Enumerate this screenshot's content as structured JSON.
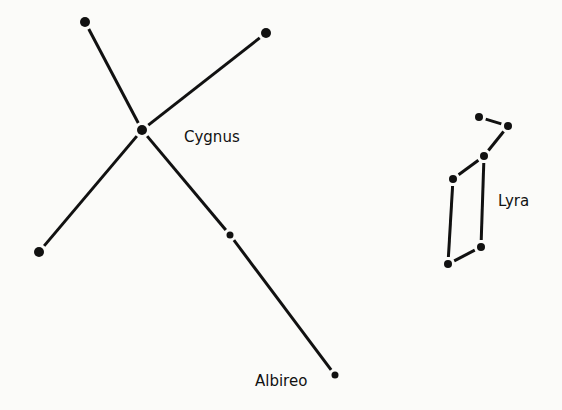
{
  "diagram": {
    "title": "",
    "background": "#fbfbf9",
    "ink": "#111111",
    "constellations": [
      {
        "name": "Cygnus",
        "label": "Cygnus",
        "label_pos": [
          184,
          142
        ],
        "stars": [
          {
            "id": "c_top_left",
            "x": 85,
            "y": 22,
            "r": 5
          },
          {
            "id": "c_top_right",
            "x": 266,
            "y": 33,
            "r": 5
          },
          {
            "id": "c_center",
            "x": 142,
            "y": 130,
            "r": 5
          },
          {
            "id": "c_bottom_left",
            "x": 39,
            "y": 252,
            "r": 5
          },
          {
            "id": "c_mid_arm",
            "x": 230,
            "y": 235,
            "r": 3.5
          },
          {
            "id": "albireo",
            "x": 335,
            "y": 375,
            "r": 3.5
          }
        ],
        "lines": [
          [
            "c_top_left",
            "c_center"
          ],
          [
            "c_top_right",
            "c_center"
          ],
          [
            "c_center",
            "c_bottom_left"
          ],
          [
            "c_center",
            "c_mid_arm"
          ],
          [
            "c_mid_arm",
            "albireo"
          ]
        ]
      },
      {
        "name": "Lyra",
        "label": "Lyra",
        "label_pos": [
          498,
          206
        ],
        "stars": [
          {
            "id": "l1",
            "x": 479,
            "y": 117,
            "r": 4
          },
          {
            "id": "l2",
            "x": 508,
            "y": 126,
            "r": 4
          },
          {
            "id": "l3",
            "x": 484,
            "y": 156,
            "r": 4
          },
          {
            "id": "l4",
            "x": 453,
            "y": 179,
            "r": 4
          },
          {
            "id": "l5",
            "x": 481,
            "y": 247,
            "r": 4
          },
          {
            "id": "l6",
            "x": 448,
            "y": 264,
            "r": 4
          }
        ],
        "lines": [
          [
            "l1",
            "l2"
          ],
          [
            "l2",
            "l3"
          ],
          [
            "l3",
            "l4"
          ],
          [
            "l4",
            "l6"
          ],
          [
            "l6",
            "l5"
          ],
          [
            "l5",
            "l3"
          ]
        ]
      }
    ],
    "star_labels": [
      {
        "text": "Albireo",
        "x": 255,
        "y": 386
      }
    ]
  }
}
